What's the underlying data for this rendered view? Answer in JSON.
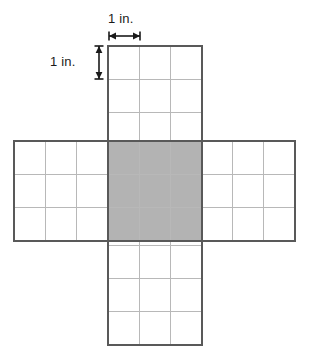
{
  "figure": {
    "unit_label_horizontal": "1 in.",
    "unit_label_vertical": "1 in.",
    "colors": {
      "background": "#ffffff",
      "outer_border": "#595959",
      "grid_line": "#b8b8b8",
      "shaded_fill": "#b3b3b3",
      "shaded_border": "#595959",
      "arrow": "#1a1a1a",
      "text": "#1a1a1a"
    },
    "geometry": {
      "cell_width_px": 31.2,
      "cell_height_px": 33.2,
      "vertical_strip": {
        "x": 108,
        "y": 46,
        "cols": 3,
        "rows": 9
      },
      "horizontal_strip": {
        "x": 14,
        "y": 141,
        "cols": 9,
        "rows": 3
      },
      "shaded_region": {
        "x": 108,
        "y": 141,
        "cols": 3,
        "rows": 3
      }
    },
    "dimension_arrows": {
      "horizontal": {
        "x1": 109,
        "x2": 140,
        "y": 36,
        "cap_height": 9
      },
      "vertical": {
        "y1": 46,
        "y2": 79,
        "x": 99,
        "cap_width": 9
      }
    }
  }
}
